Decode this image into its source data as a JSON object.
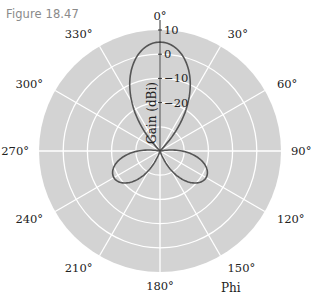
{
  "figure": {
    "label": "Figure 18.47"
  },
  "chart_data": {
    "type": "polar-line",
    "title": "",
    "radial_axis": {
      "label": "Gain (dBi)",
      "ticks": [
        10,
        0,
        -10,
        -20
      ],
      "range": [
        -40,
        10
      ],
      "rings": [
        -30,
        -20,
        -10,
        0,
        10
      ]
    },
    "angular_axis": {
      "label": "Phi",
      "direction": "clockwise",
      "zero_at": "top",
      "ticks": [
        "0°",
        "30°",
        "60°",
        "90°",
        "120°",
        "150°",
        "180°",
        "210°",
        "240°",
        "270°",
        "300°",
        "330°"
      ]
    },
    "grid": true,
    "background": "#d3d3d3",
    "series": [
      {
        "name": "pattern",
        "color": "#555555",
        "lobes": [
          {
            "direction_deg": 0,
            "peak_gain_dbi": 5,
            "half_width_deg": 20
          },
          {
            "direction_deg": 120,
            "peak_gain_dbi": -18,
            "half_width_deg": 18
          },
          {
            "direction_deg": 240,
            "peak_gain_dbi": -18,
            "half_width_deg": 18
          }
        ]
      }
    ]
  }
}
